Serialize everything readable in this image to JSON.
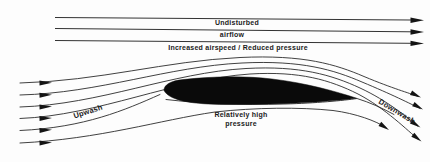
{
  "canvas": {
    "background": "#fdfdfd",
    "ink": "#1b1b1b"
  },
  "top_flow": {
    "label_line1": "Undisturbed",
    "label_line2": "airflow",
    "label_below": "Increased airspeed / Reduced pressure"
  },
  "left_flow": {
    "label": "Upwash"
  },
  "right_flow": {
    "label": "Downwash"
  },
  "lower_flow": {
    "label_line1": "Relatively high",
    "label_line2": "pressure"
  }
}
